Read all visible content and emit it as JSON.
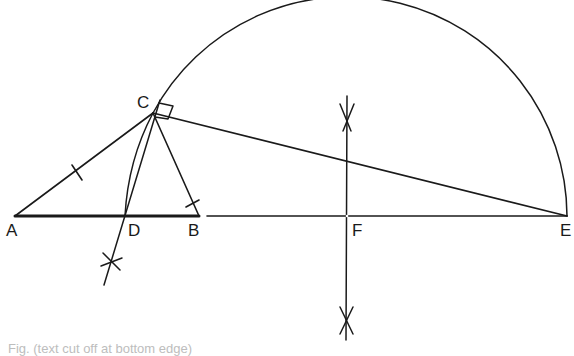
{
  "diagram": {
    "type": "geometric-construction",
    "points": {
      "A": {
        "label": "A",
        "x": 15,
        "y": 216
      },
      "D": {
        "label": "D",
        "x": 125,
        "y": 216
      },
      "B": {
        "label": "B",
        "x": 199,
        "y": 216
      },
      "F": {
        "label": "F",
        "x": 347,
        "y": 216
      },
      "E": {
        "label": "E",
        "x": 567,
        "y": 216
      },
      "C": {
        "label": "C",
        "x": 153,
        "y": 113
      }
    },
    "segments": [
      {
        "from": "A",
        "to": "B",
        "style": "thick"
      },
      {
        "from": "B",
        "to": "E",
        "style": "thin",
        "note": "baseline continues from just after B to E"
      },
      {
        "from": "A",
        "to": "C",
        "tick": true
      },
      {
        "from": "C",
        "to": "B",
        "tick": true
      },
      {
        "from": "C",
        "to": "D",
        "note": "extended below D to construction cross"
      },
      {
        "from": "C",
        "to": "E"
      }
    ],
    "arcs": [
      {
        "name": "semicircle",
        "center": "F",
        "radius": 220,
        "from": "C",
        "to": "E"
      },
      {
        "name": "arc-C-D",
        "note": "small arc from C down to D"
      }
    ],
    "right_angle_marker": {
      "at": "C",
      "between": [
        "B",
        "E"
      ]
    },
    "perpendicular_bisector": {
      "x": 347,
      "y_top": 90,
      "y_bottom": 340,
      "arrow_marks": [
        117,
        320
      ]
    },
    "construction_cross": {
      "x": 111,
      "y": 262
    },
    "caption": "Fig. (text cut off at bottom edge)"
  },
  "colors": {
    "stroke": "#1a1a1a",
    "background": "#ffffff"
  }
}
